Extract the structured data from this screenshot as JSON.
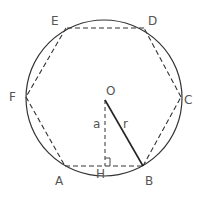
{
  "diagram": {
    "circle": {
      "cx": 104,
      "cy": 98,
      "r": 78,
      "stroke": "#333333"
    },
    "center": {
      "label": "O",
      "x": 105,
      "y": 100
    },
    "vertices": [
      {
        "label": "A",
        "x": 65,
        "y": 166
      },
      {
        "label": "B",
        "x": 143,
        "y": 166
      },
      {
        "label": "C",
        "x": 181,
        "y": 97
      },
      {
        "label": "D",
        "x": 144,
        "y": 28
      },
      {
        "label": "E",
        "x": 66,
        "y": 28
      },
      {
        "label": "F",
        "x": 26,
        "y": 97
      }
    ],
    "foot": {
      "label": "H",
      "x": 105,
      "y": 166
    },
    "segments": {
      "apothem_label": "a",
      "radius_label": "r"
    },
    "labels": {
      "E": "E",
      "D": "D",
      "F": "F",
      "C": "C",
      "A": "A",
      "B": "B",
      "H": "H",
      "O": "O",
      "a": "a",
      "r": "r"
    },
    "colors": {
      "stroke": "#333333",
      "label": "#555555"
    }
  }
}
